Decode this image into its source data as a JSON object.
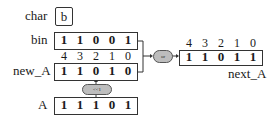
{
  "char": {
    "label": "char",
    "value": "b"
  },
  "bin": {
    "label": "bin",
    "bits": [
      "1",
      "1",
      "0",
      "0",
      "1"
    ]
  },
  "indices_left": [
    "4",
    "3",
    "2",
    "1",
    "0"
  ],
  "new_A": {
    "label": "new_A",
    "bits": [
      "1",
      "1",
      "0",
      "1",
      "0"
    ]
  },
  "shift": {
    "label": "<<1"
  },
  "A": {
    "label": "A",
    "bits": [
      "1",
      "1",
      "1",
      "0",
      "1"
    ]
  },
  "or_op": {
    "label": "or"
  },
  "indices_right": [
    "4",
    "3",
    "2",
    "1",
    "0"
  ],
  "next_A": {
    "label": "next_A",
    "bits": [
      "1",
      "1",
      "0",
      "1",
      "1"
    ]
  }
}
